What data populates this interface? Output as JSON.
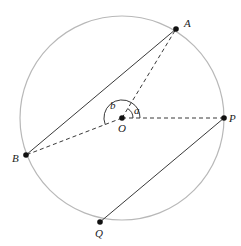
{
  "diagram": {
    "type": "circle-geometry",
    "circle": {
      "cx": 122,
      "cy": 118,
      "r": 102,
      "stroke": "#b8b8b8"
    },
    "points": [
      {
        "id": "A",
        "label": "A",
        "x": 176,
        "y": 29,
        "lx": 184,
        "ly": 27
      },
      {
        "id": "O",
        "label": "O",
        "x": 122,
        "y": 118,
        "lx": 118,
        "ly": 132
      },
      {
        "id": "P",
        "label": "P",
        "x": 224,
        "y": 118,
        "lx": 229,
        "ly": 122
      },
      {
        "id": "B",
        "label": "B",
        "x": 26,
        "y": 155,
        "lx": 12,
        "ly": 162
      },
      {
        "id": "Q",
        "label": "Q",
        "x": 100,
        "y": 222,
        "lx": 95,
        "ly": 237
      }
    ],
    "angle_labels": [
      {
        "id": "a",
        "label": "a",
        "x": 134,
        "y": 114
      },
      {
        "id": "b",
        "label": "b",
        "x": 110,
        "y": 109
      }
    ],
    "solid_segments": [
      [
        "A",
        "B"
      ],
      [
        "P",
        "Q"
      ]
    ],
    "dashed_segments": [
      [
        "O",
        "A"
      ],
      [
        "O",
        "P"
      ],
      [
        "O",
        "B"
      ]
    ]
  }
}
